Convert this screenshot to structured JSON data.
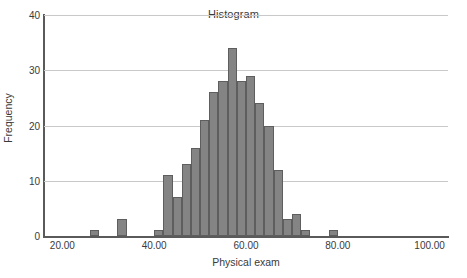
{
  "chart_data": {
    "type": "bar",
    "title": "Histogram",
    "xlabel": "Physical exam",
    "ylabel": "Frequency",
    "xlim": [
      16,
      104
    ],
    "ylim": [
      0,
      40
    ],
    "grid": true,
    "legend": false,
    "bin_width": 2,
    "xticks": [
      {
        "value": 20,
        "label": "20.00"
      },
      {
        "value": 40,
        "label": "40.00"
      },
      {
        "value": 60,
        "label": "60.00"
      },
      {
        "value": 80,
        "label": "80.00"
      },
      {
        "value": 100,
        "label": "100.00"
      }
    ],
    "yticks": [
      {
        "value": 0,
        "label": "0"
      },
      {
        "value": 10,
        "label": "10"
      },
      {
        "value": 20,
        "label": "20"
      },
      {
        "value": 30,
        "label": "30"
      },
      {
        "value": 40,
        "label": "40"
      }
    ],
    "bars": [
      {
        "bin_start": 26,
        "bin_end": 28,
        "center": 27,
        "value": 1
      },
      {
        "bin_start": 32,
        "bin_end": 34,
        "center": 33,
        "value": 3
      },
      {
        "bin_start": 40,
        "bin_end": 42,
        "center": 41,
        "value": 1
      },
      {
        "bin_start": 42,
        "bin_end": 44,
        "center": 43,
        "value": 11
      },
      {
        "bin_start": 44,
        "bin_end": 46,
        "center": 45,
        "value": 7
      },
      {
        "bin_start": 46,
        "bin_end": 48,
        "center": 47,
        "value": 13
      },
      {
        "bin_start": 48,
        "bin_end": 50,
        "center": 49,
        "value": 16
      },
      {
        "bin_start": 50,
        "bin_end": 52,
        "center": 51,
        "value": 21
      },
      {
        "bin_start": 52,
        "bin_end": 54,
        "center": 53,
        "value": 26
      },
      {
        "bin_start": 54,
        "bin_end": 56,
        "center": 55,
        "value": 28
      },
      {
        "bin_start": 56,
        "bin_end": 58,
        "center": 57,
        "value": 34
      },
      {
        "bin_start": 58,
        "bin_end": 60,
        "center": 59,
        "value": 28
      },
      {
        "bin_start": 60,
        "bin_end": 62,
        "center": 61,
        "value": 29
      },
      {
        "bin_start": 62,
        "bin_end": 64,
        "center": 63,
        "value": 24
      },
      {
        "bin_start": 64,
        "bin_end": 66,
        "center": 65,
        "value": 20
      },
      {
        "bin_start": 66,
        "bin_end": 68,
        "center": 67,
        "value": 12
      },
      {
        "bin_start": 68,
        "bin_end": 70,
        "center": 69,
        "value": 3
      },
      {
        "bin_start": 70,
        "bin_end": 72,
        "center": 71,
        "value": 4
      },
      {
        "bin_start": 72,
        "bin_end": 74,
        "center": 73,
        "value": 1
      },
      {
        "bin_start": 78,
        "bin_end": 80,
        "center": 79,
        "value": 1
      }
    ],
    "colors": {
      "bar_fill": "#848484",
      "bar_border": "#5e5e5e",
      "gridline": "#c9c9c9",
      "axis": "#5a5a5a",
      "text": "#3a3a3a",
      "background": "#ffffff"
    }
  }
}
